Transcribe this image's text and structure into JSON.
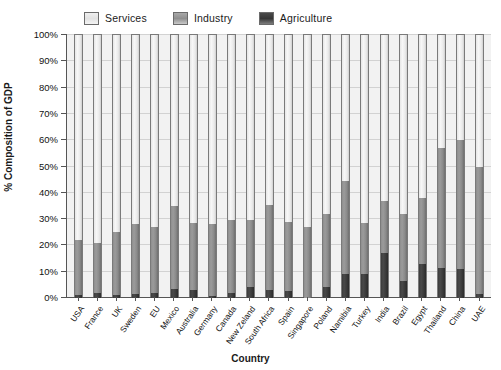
{
  "chart_data": {
    "type": "bar",
    "stacked": true,
    "title": "",
    "xlabel": "Country",
    "ylabel": "% Composition of GDP",
    "ylim": [
      0,
      100
    ],
    "ytick_labels": [
      "100%",
      "90%",
      "80%",
      "70%",
      "60%",
      "50%",
      "40%",
      "30%",
      "20%",
      "10%",
      "0%"
    ],
    "ytick_values": [
      100,
      90,
      80,
      70,
      60,
      50,
      40,
      30,
      20,
      10,
      0
    ],
    "grid": true,
    "legend_position": "top",
    "categories": [
      "USA",
      "France",
      "UK",
      "Sweden",
      "EU",
      "Mexico",
      "Australia",
      "Germany",
      "Canada",
      "New Zeland",
      "South Africa",
      "Spain",
      "Singapore",
      "Poland",
      "Namibia",
      "Turkey",
      "India",
      "Brazil",
      "Egypt",
      "Thailand",
      "China",
      "UAE"
    ],
    "series": [
      {
        "name": "Agriculture",
        "color": "#3b3b3b",
        "values": [
          1.2,
          2.0,
          1.0,
          1.5,
          1.8,
          3.5,
          3.0,
          0.9,
          2.0,
          4.2,
          3.0,
          2.8,
          0.0,
          4.0,
          9.0,
          9.0,
          17.0,
          6.5,
          13.0,
          11.5,
          11.0,
          1.5
        ]
      },
      {
        "name": "Industry",
        "color": "#8e8e8e",
        "values": [
          20.8,
          19.0,
          24.0,
          26.5,
          25.2,
          31.5,
          25.5,
          27.1,
          27.5,
          25.3,
          32.5,
          26.2,
          27.0,
          28.0,
          35.5,
          19.5,
          20.0,
          25.5,
          25.0,
          45.5,
          49.0,
          48.5
        ]
      },
      {
        "name": "Services",
        "color": "#eaeaea",
        "values": [
          78.0,
          79.0,
          75.0,
          72.0,
          73.0,
          65.0,
          71.5,
          72.0,
          70.5,
          70.5,
          64.5,
          71.0,
          73.0,
          68.0,
          55.5,
          71.5,
          63.0,
          68.0,
          62.0,
          43.0,
          40.0,
          50.0
        ]
      }
    ],
    "cumulative_tops": {
      "agriculture_plus_industry": [
        22.0,
        21.0,
        25.0,
        28.0,
        27.0,
        35.0,
        28.5,
        28.0,
        29.5,
        29.5,
        35.5,
        29.0,
        27.0,
        32.0,
        44.5,
        28.5,
        37.0,
        32.0,
        38.0,
        57.0,
        60.0,
        50.0
      ]
    }
  },
  "legend": {
    "items": [
      {
        "label": "Services",
        "swatch": "services-swatch"
      },
      {
        "label": "Industry",
        "swatch": "industry-swatch"
      },
      {
        "label": "Agriculture",
        "swatch": "agriculture-swatch"
      }
    ]
  },
  "axes": {
    "y_title": "% Composition of GDP",
    "x_title": "Country"
  }
}
